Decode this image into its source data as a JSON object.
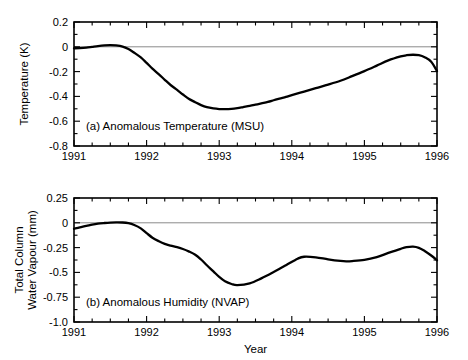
{
  "figure": {
    "background": "#ffffff",
    "line_color": "#000000",
    "zero_line_color": "#8a8a8a",
    "axis_color": "#000000",
    "xlabel": "Year"
  },
  "chart_data": [
    {
      "type": "line",
      "panel": "a",
      "title": "(a) Anomalous Temperature (MSU)",
      "xlabel": "Year",
      "ylabel": "Temperature (K)",
      "xlim": [
        1991,
        1996
      ],
      "ylim": [
        -0.8,
        0.2
      ],
      "xticks": [
        1991,
        1992,
        1993,
        1994,
        1995,
        1996
      ],
      "xtick_labels": [
        "1991",
        "1992",
        "1993",
        "1994",
        "1995",
        "1996"
      ],
      "yticks": [
        0.2,
        0,
        -0.2,
        -0.4,
        -0.6,
        -0.8
      ],
      "ytick_labels": [
        "0.2",
        "0",
        "-0.2",
        "-0.4",
        "-0.6",
        "-0.8"
      ],
      "minor_xtick_interval": 0.25,
      "grid": false,
      "legend": "none",
      "zero_reference_line": 0,
      "series": [
        {
          "name": "Anomalous Temperature (MSU)",
          "units": "K",
          "x": [
            1991.0,
            1991.08,
            1991.17,
            1991.25,
            1991.33,
            1991.42,
            1991.5,
            1991.58,
            1991.67,
            1991.75,
            1991.83,
            1991.92,
            1992.0,
            1992.08,
            1992.17,
            1992.25,
            1992.33,
            1992.42,
            1992.5,
            1992.58,
            1992.67,
            1992.75,
            1992.83,
            1992.92,
            1993.0,
            1993.08,
            1993.17,
            1993.25,
            1993.33,
            1993.42,
            1993.5,
            1993.58,
            1993.67,
            1993.75,
            1993.83,
            1993.92,
            1994.0,
            1994.17,
            1994.33,
            1994.5,
            1994.67,
            1994.83,
            1995.0,
            1995.17,
            1995.33,
            1995.5,
            1995.58,
            1995.67,
            1995.75,
            1995.83,
            1995.92,
            1996.0
          ],
          "y": [
            -0.012,
            -0.01,
            -0.006,
            0.0,
            0.006,
            0.011,
            0.013,
            0.011,
            0.002,
            -0.018,
            -0.048,
            -0.086,
            -0.13,
            -0.176,
            -0.222,
            -0.266,
            -0.308,
            -0.348,
            -0.385,
            -0.419,
            -0.447,
            -0.47,
            -0.487,
            -0.497,
            -0.502,
            -0.503,
            -0.5,
            -0.494,
            -0.486,
            -0.477,
            -0.467,
            -0.456,
            -0.444,
            -0.431,
            -0.418,
            -0.404,
            -0.39,
            -0.361,
            -0.333,
            -0.305,
            -0.274,
            -0.237,
            -0.196,
            -0.152,
            -0.11,
            -0.078,
            -0.068,
            -0.064,
            -0.068,
            -0.084,
            -0.12,
            -0.196
          ]
        }
      ]
    },
    {
      "type": "line",
      "panel": "b",
      "title": "(b) Anomalous Humidity (NVAP)",
      "xlabel": "Year",
      "ylabel": "Total Column\nWater Vapour (mm)",
      "ylabel_line1": "Total Column",
      "ylabel_line2": "Water Vapour (mm)",
      "xlim": [
        1991,
        1996
      ],
      "ylim": [
        -1.0,
        0.25
      ],
      "xticks": [
        1991,
        1992,
        1993,
        1994,
        1995,
        1996
      ],
      "xtick_labels": [
        "1991",
        "1992",
        "1993",
        "1994",
        "1995",
        "1996"
      ],
      "yticks": [
        0.25,
        0,
        -0.25,
        -0.5,
        -0.75,
        -1.0
      ],
      "ytick_labels": [
        "0.25",
        "0",
        "-0.25",
        "-0.5",
        "-0.75",
        "-1.0"
      ],
      "minor_xtick_interval": 0.25,
      "grid": false,
      "legend": "none",
      "zero_reference_line": 0,
      "series": [
        {
          "name": "Anomalous Humidity (NVAP)",
          "units": "mm",
          "x": [
            1991.0,
            1991.08,
            1991.17,
            1991.25,
            1991.33,
            1991.42,
            1991.5,
            1991.58,
            1991.67,
            1991.75,
            1991.83,
            1991.92,
            1992.0,
            1992.08,
            1992.17,
            1992.25,
            1992.33,
            1992.42,
            1992.5,
            1992.58,
            1992.67,
            1992.75,
            1992.83,
            1992.92,
            1993.0,
            1993.08,
            1993.17,
            1993.25,
            1993.42,
            1993.58,
            1993.75,
            1993.92,
            1994.08,
            1994.17,
            1994.33,
            1994.5,
            1994.67,
            1994.75,
            1994.83,
            1995.0,
            1995.17,
            1995.33,
            1995.5,
            1995.58,
            1995.67,
            1995.75,
            1995.83,
            1995.92,
            1996.0
          ],
          "y": [
            -0.06,
            -0.046,
            -0.032,
            -0.018,
            -0.008,
            -0.002,
            0.002,
            0.004,
            0.003,
            -0.004,
            -0.022,
            -0.056,
            -0.104,
            -0.15,
            -0.186,
            -0.212,
            -0.23,
            -0.246,
            -0.264,
            -0.288,
            -0.322,
            -0.37,
            -0.428,
            -0.49,
            -0.546,
            -0.59,
            -0.617,
            -0.628,
            -0.61,
            -0.56,
            -0.496,
            -0.428,
            -0.362,
            -0.342,
            -0.348,
            -0.368,
            -0.384,
            -0.388,
            -0.386,
            -0.374,
            -0.346,
            -0.304,
            -0.262,
            -0.246,
            -0.24,
            -0.252,
            -0.284,
            -0.33,
            -0.378
          ]
        }
      ]
    }
  ]
}
